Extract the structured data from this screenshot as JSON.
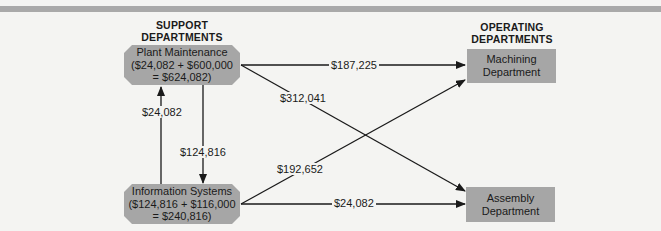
{
  "headings": {
    "support": [
      "SUPPORT",
      "DEPARTMENTS"
    ],
    "operating": [
      "OPERATING",
      "DEPARTMENTS"
    ]
  },
  "nodes": {
    "plant_maintenance": {
      "name": "Plant Maintenance",
      "line2": "($24,082 + $600,000",
      "line3": "= $624,082)"
    },
    "information_systems": {
      "name": "Information Systems",
      "line2": "($124,816 + $116,000",
      "line3": "= $240,816)"
    },
    "machining": {
      "line1": "Machining",
      "line2": "Department"
    },
    "assembly": {
      "line1": "Assembly",
      "line2": "Department"
    }
  },
  "flows": {
    "is_to_pm": "$24,082",
    "pm_to_is": "$124,816",
    "pm_to_machining": "$187,225",
    "pm_to_assembly": "$312,041",
    "is_to_machining": "$192,652",
    "is_to_assembly": "$24,082"
  },
  "colors": {
    "box_fill": "#a6a6a6",
    "background": "#f4f4f2",
    "top_bar": "#a9a9a9",
    "line": "#1a1a1a"
  }
}
